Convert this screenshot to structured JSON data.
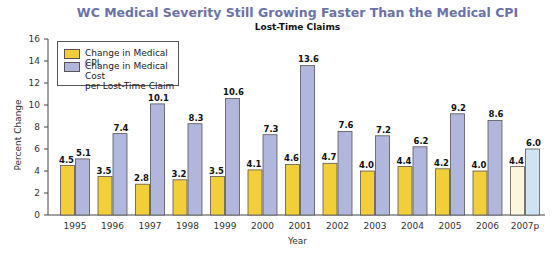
{
  "chart_data": {
    "type": "bar",
    "title": "WC Medical Severity Still Growing Faster Than the Medical CPI",
    "subtitle": "Lost-Time Claims",
    "xlabel": "Year",
    "ylabel": "Percent Change",
    "ylim": [
      0,
      16
    ],
    "yticks": [
      0,
      2,
      4,
      6,
      8,
      10,
      12,
      14,
      16
    ],
    "grid": false,
    "legend_position": "top-left",
    "categories": [
      "1995",
      "1996",
      "1997",
      "1998",
      "1999",
      "2000",
      "2001",
      "2002",
      "2003",
      "2004",
      "2005",
      "2006",
      "2007p"
    ],
    "series": [
      {
        "name": "Change in Medical CPI",
        "color": "#f2cf3a",
        "values": [
          4.5,
          3.5,
          2.8,
          3.2,
          3.5,
          4.1,
          4.6,
          4.7,
          4.0,
          4.4,
          4.2,
          4.0,
          4.4
        ]
      },
      {
        "name": "Change in Medical Cost per Lost-Time Claim",
        "color": "#b1b6dc",
        "values": [
          5.1,
          7.4,
          10.1,
          8.3,
          10.6,
          7.3,
          13.6,
          7.6,
          7.2,
          6.2,
          9.2,
          8.6,
          6.0
        ]
      }
    ],
    "preliminary_colors": {
      "cpi": "#fbf6dc",
      "cost": "#cfe3f3"
    }
  },
  "legend": {
    "items": [
      {
        "label_lines": [
          "Change in Medical CPI"
        ],
        "color": "#f2cf3a"
      },
      {
        "label_lines": [
          "Change in Medical Cost",
          "per Lost-Time Claim"
        ],
        "color": "#b1b6dc"
      }
    ]
  }
}
